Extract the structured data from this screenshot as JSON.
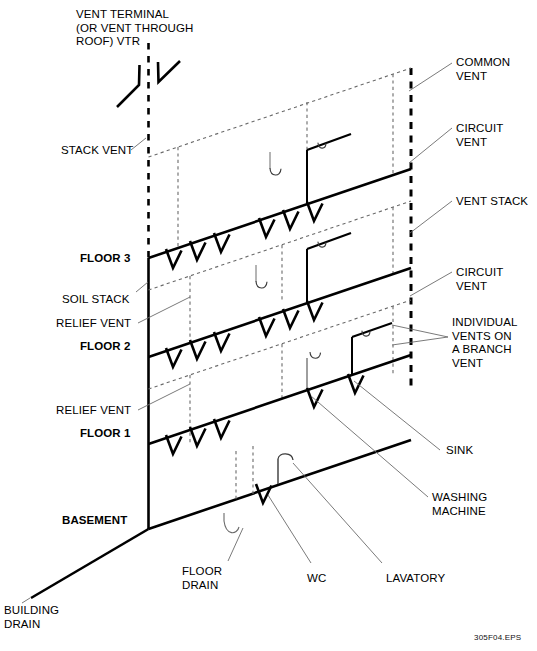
{
  "figure": {
    "figure_id": "305F04.EPS",
    "line_color": "#000000",
    "hidden_line_color": "#5a5a5a",
    "leader_color": "#6b6b6b",
    "background": "#ffffff"
  },
  "labels": {
    "vent_terminal": "VENT TERMINAL\n(OR VENT THROUGH\nROOF) VTR",
    "stack_vent": "STACK VENT",
    "common_vent": "COMMON\nVENT",
    "circuit_vent_top": "CIRCUIT\nVENT",
    "vent_stack": "VENT STACK",
    "circuit_vent_mid": "CIRCUIT\nVENT",
    "individual_vents": "INDIVIDUAL\nVENTS ON\nA BRANCH\nVENT",
    "floor_3": "FLOOR 3",
    "soil_stack": "SOIL STACK",
    "relief_vent_upper": "RELIEF VENT",
    "floor_2": "FLOOR 2",
    "relief_vent_lower": "RELIEF VENT",
    "floor_1": "FLOOR 1",
    "basement": "BASEMENT",
    "sink": "SINK",
    "washing_machine": "WASHING\nMACHINE",
    "floor_drain": "FLOOR\nDRAIN",
    "wc": "WC",
    "lavatory": "LAVATORY",
    "building_drain": "BUILDING\nDRAIN"
  }
}
